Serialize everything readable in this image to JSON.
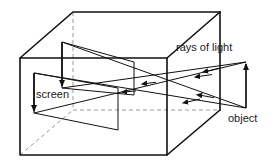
{
  "figure": {
    "background": "#ffffff",
    "stroke": "#111111",
    "dash_stroke": "#9a9a9a",
    "width": 279,
    "height": 167
  },
  "labels": {
    "screen": "screen",
    "rays_of_light": "rays of light",
    "object": "object"
  },
  "elements": {
    "box": {
      "name": "pinhole-box",
      "front_face": [
        [
          20,
          58
        ],
        [
          167,
          58
        ],
        [
          167,
          155
        ],
        [
          20,
          155
        ]
      ],
      "top_back_edge": [
        [
          73,
          12
        ],
        [
          220,
          12
        ]
      ],
      "back_face": [
        [
          73,
          12
        ],
        [
          220,
          12
        ],
        [
          220,
          108
        ],
        [
          73,
          108
        ]
      ],
      "edges_visible": [
        [
          [
            20,
            58
          ],
          [
            73,
            12
          ]
        ],
        [
          [
            167,
            58
          ],
          [
            220,
            12
          ]
        ],
        [
          [
            167,
            155
          ],
          [
            220,
            108
          ]
        ],
        [
          [
            20,
            155
          ],
          [
            73,
            108
          ]
        ]
      ],
      "hidden_edges_dashed": [
        [
          [
            73,
            12
          ],
          [
            73,
            108
          ]
        ],
        [
          [
            73,
            108
          ],
          [
            220,
            108
          ]
        ],
        [
          [
            20,
            155
          ],
          [
            73,
            108
          ]
        ]
      ]
    },
    "screen_plane": {
      "name": "screen-plane",
      "quad": [
        [
          34,
          73
        ],
        [
          118,
          88
        ],
        [
          118,
          130
        ],
        [
          34,
          113
        ]
      ]
    },
    "inner_image_plane": {
      "name": "inner-image-plane",
      "quad": [
        [
          62,
          42
        ],
        [
          134,
          62
        ],
        [
          134,
          95
        ],
        [
          62,
          88
        ]
      ]
    },
    "image_arrow_on_screen": {
      "name": "inverted-image-arrow",
      "from": [
        34,
        73
      ],
      "to": [
        34,
        113
      ],
      "direction": "down"
    },
    "image_arrow_inner": {
      "name": "inverted-image-arrow-inner",
      "from": [
        62,
        42
      ],
      "to": [
        62,
        88
      ],
      "direction": "down"
    },
    "object_arrow": {
      "name": "object-arrow",
      "from": [
        246,
        108
      ],
      "to": [
        246,
        62
      ],
      "direction": "up"
    },
    "pinhole": [
      140,
      86
    ],
    "rays": [
      {
        "name": "ray-top-to-screen-bottom",
        "from": [
          246,
          62
        ],
        "to": [
          34,
          113
        ]
      },
      {
        "name": "ray-bottom-to-screen-top",
        "from": [
          246,
          108
        ],
        "to": [
          34,
          73
        ]
      },
      {
        "name": "ray-top-to-inner-bottom",
        "from": [
          246,
          62
        ],
        "to": [
          62,
          88
        ]
      },
      {
        "name": "ray-bottom-to-inner-top",
        "from": [
          246,
          108
        ],
        "to": [
          62,
          42
        ]
      }
    ]
  }
}
